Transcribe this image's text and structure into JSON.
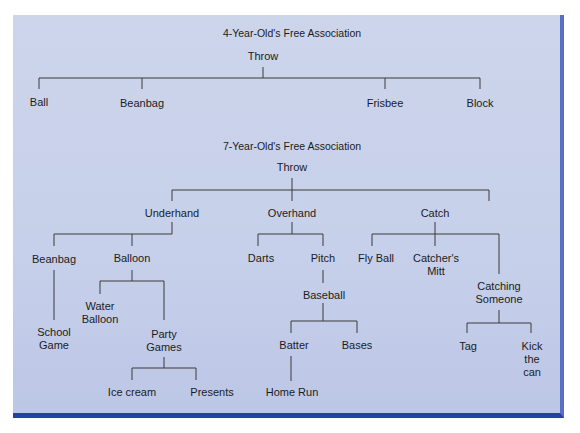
{
  "diagram": {
    "colors": {
      "panel": "#c9d2ea",
      "right_border": "#5a6fc4",
      "bottom_border": "#2340a8",
      "lines": "#3a3a3a"
    },
    "tree1": {
      "title": "4-Year-Old's Free Association",
      "root": "Throw",
      "children": [
        "Ball",
        "Beanbag",
        "Frisbee",
        "Block"
      ]
    },
    "tree2": {
      "title": "7-Year-Old's Free Association",
      "root": "Throw",
      "nodes": {
        "underhand": "Underhand",
        "overhand": "Overhand",
        "catch": "Catch",
        "beanbag": "Beanbag",
        "balloon": "Balloon",
        "school_game": "School\nGame",
        "water_balloon": "Water\nBalloon",
        "party_games": "Party\nGames",
        "ice_cream": "Ice cream",
        "presents": "Presents",
        "darts": "Darts",
        "pitch": "Pitch",
        "baseball": "Baseball",
        "batter": "Batter",
        "bases": "Bases",
        "home_run": "Home Run",
        "fly_ball": "Fly Ball",
        "catchers_mitt": "Catcher's\nMitt",
        "catching_someone": "Catching\nSomeone",
        "tag": "Tag",
        "kick_the_can": "Kick\nthe\ncan"
      }
    }
  }
}
